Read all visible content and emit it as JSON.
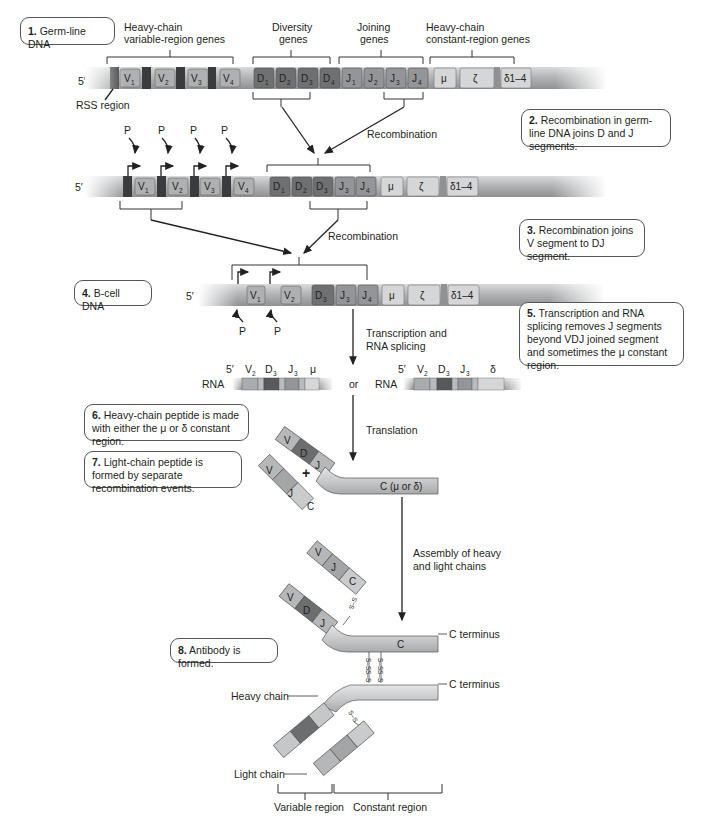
{
  "steps": [
    {
      "num": "1.",
      "text": "Germ-line DNA"
    },
    {
      "num": "2.",
      "text": "Recombination in germ-line DNA joins D and J segments."
    },
    {
      "num": "3.",
      "text": "Recombination joins V segment to DJ segment."
    },
    {
      "num": "4.",
      "text": "B-cell DNA"
    },
    {
      "num": "5.",
      "text": "Transcription and RNA splicing removes J segments beyond VDJ joined segment and sometimes the μ constant region."
    },
    {
      "num": "6.",
      "text": "Heavy-chain peptide is made with either the μ or δ constant region."
    },
    {
      "num": "7.",
      "text": "Light-chain peptide is formed by separate recombination events."
    },
    {
      "num": "8.",
      "text": "Antibody is formed."
    }
  ],
  "row1": {
    "five_prime": "5′",
    "group_labels": {
      "variable_l1": "Heavy-chain",
      "variable_l2": "variable-region genes",
      "diversity_l1": "Diversity",
      "diversity_l2": "genes",
      "joining_l1": "Joining",
      "joining_l2": "genes",
      "constant_l1": "Heavy-chain",
      "constant_l2": "constant-region genes"
    },
    "rss_label": "RSS region",
    "segments": {
      "v": [
        "V",
        "V",
        "V",
        "V"
      ],
      "v_sub": [
        "1",
        "2",
        "3",
        "4"
      ],
      "d": [
        "D",
        "D",
        "D",
        "D"
      ],
      "d_sub": [
        "1",
        "2",
        "3",
        "4"
      ],
      "j": [
        "J",
        "J",
        "J",
        "J"
      ],
      "j_sub": [
        "1",
        "2",
        "3",
        "4"
      ],
      "c": [
        "μ",
        "ζ",
        "δ1–4"
      ]
    }
  },
  "row2": {
    "five_prime": "5′",
    "promoter": "P",
    "segments": {
      "v": [
        "V",
        "V",
        "V",
        "V"
      ],
      "v_sub": [
        "1",
        "2",
        "3",
        "4"
      ],
      "dj": [
        "D",
        "D",
        "D",
        "J",
        "J"
      ],
      "dj_sub": [
        "1",
        "2",
        "3",
        "3",
        "4"
      ],
      "c": [
        "μ",
        "ζ",
        "δ1–4"
      ]
    }
  },
  "row3": {
    "five_prime": "5′",
    "promoter": "P",
    "segments": {
      "v": [
        "V",
        "V"
      ],
      "v_sub": [
        "1",
        "2"
      ],
      "dj": [
        "D",
        "J",
        "J"
      ],
      "dj_sub": [
        "3",
        "3",
        "4"
      ],
      "c": [
        "μ",
        "ζ",
        "δ1–4"
      ]
    }
  },
  "arrows": {
    "recombination1": "Recombination",
    "recombination2": "Recombination",
    "transcription_l1": "Transcription and",
    "transcription_l2": "RNA splicing",
    "translation": "Translation",
    "assembly_l1": "Assembly of heavy",
    "assembly_l2": "and light chains"
  },
  "rna": {
    "label": "RNA",
    "or": "or",
    "five_prime": "5′",
    "left": {
      "seg": [
        "V",
        "D",
        "J",
        "μ"
      ],
      "sub": [
        "2",
        "3",
        "3",
        ""
      ]
    },
    "right": {
      "seg": [
        "V",
        "D",
        "J",
        "δ"
      ],
      "sub": [
        "2",
        "3",
        "3",
        ""
      ]
    }
  },
  "peptides": {
    "heavy_segments": [
      "V",
      "D",
      "J"
    ],
    "heavy_constant": "C (μ or δ)",
    "light_segments": [
      "V",
      "J",
      "C"
    ],
    "plus": "+",
    "assembled_constant": "C",
    "c_terminus": "C terminus",
    "disulfide": "S–S"
  },
  "antibody": {
    "heavy_chain": "Heavy chain",
    "light_chain": "Light chain",
    "variable_region": "Variable region",
    "constant_region": "Constant region",
    "c_terminus": "C terminus"
  },
  "colors": {
    "dna_body": "#b9bcbe",
    "rss": "#3a3b3d",
    "v_seg": "#a9acae",
    "d_seg": "#6e7072",
    "j_seg": "#939598",
    "c_seg": "#d4d6d7",
    "protein_light": "#c9cbcc",
    "protein_dark": "#6b6d6f"
  }
}
